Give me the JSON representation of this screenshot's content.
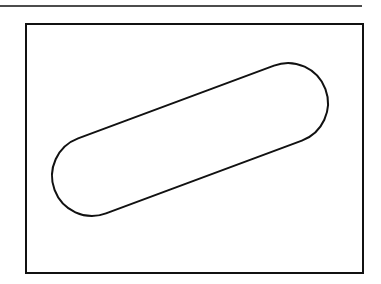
{
  "figure": {
    "colors": {
      "background": "#ffffff",
      "stroke": "#111111"
    },
    "top_rule": {
      "x1": 0,
      "y1": 6,
      "x2": 362,
      "y2": 6
    },
    "frame": {
      "x": 26,
      "y": 24,
      "width": 337,
      "height": 249
    },
    "slot": {
      "center_x": 190,
      "center_y": 139.5,
      "straight_length": 209,
      "radius": 40,
      "rotation_deg": -20.4
    }
  }
}
